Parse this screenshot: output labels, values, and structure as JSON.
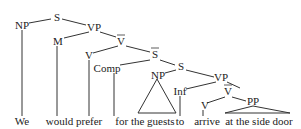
{
  "diagram": {
    "type": "syntax-tree",
    "nodes": {
      "s1": "S",
      "np1": "NP",
      "vp1": "VP",
      "m": "M",
      "vbar1": "V",
      "v1": "V",
      "sbar": "S",
      "comp": "Comp",
      "s2": "S",
      "np2": "NP",
      "vp2": "VP",
      "inf": "Inf",
      "vbar2": "V",
      "v2": "V",
      "pp": "PP"
    },
    "words": {
      "w1": "We",
      "w2": "would prefer",
      "w3": "for the guests",
      "w4": "to",
      "w5": "arrive",
      "w6": "at the side door"
    }
  }
}
